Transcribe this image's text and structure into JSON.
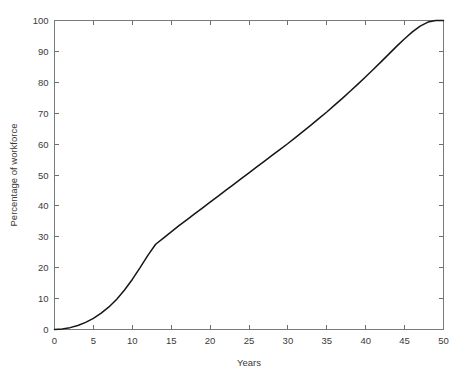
{
  "chart_data": {
    "type": "line",
    "title": "",
    "subtitle": "",
    "xlabel": "Years",
    "ylabel": "Percentage of workforce",
    "xlim": [
      0,
      50
    ],
    "ylim": [
      0,
      100
    ],
    "xticks": [
      0,
      5,
      10,
      15,
      20,
      25,
      30,
      35,
      40,
      45,
      50
    ],
    "xtick_labels": [
      "0",
      "5",
      "10",
      "15",
      "20",
      "25",
      "30",
      "35",
      "40",
      "45",
      "50"
    ],
    "yticks": [
      0,
      10,
      20,
      30,
      40,
      50,
      60,
      70,
      80,
      90,
      100
    ],
    "ytick_labels": [
      "0",
      "10",
      "20",
      "30",
      "40",
      "50",
      "60",
      "70",
      "80",
      "90",
      "100"
    ],
    "grid": false,
    "legend": false,
    "legend_position": "none",
    "line_color": "#161616",
    "line_width": 1.5,
    "frame_color": "#7a7a7a",
    "background_color": "#ffffff",
    "tick_direction": "in",
    "ticks_on_all_sides": true,
    "annotations": [],
    "series": [
      {
        "name": "Percentage of workforce",
        "x": [
          0,
          1,
          2,
          3,
          4,
          5,
          6,
          7,
          8,
          9,
          10,
          11,
          12,
          13,
          14,
          15,
          16,
          17,
          18,
          19,
          20,
          21,
          22,
          23,
          24,
          25,
          26,
          27,
          28,
          29,
          30,
          31,
          32,
          33,
          34,
          35,
          36,
          37,
          38,
          39,
          40,
          41,
          42,
          43,
          44,
          45,
          46,
          47,
          48,
          49,
          50
        ],
        "values": [
          0.0,
          0.2,
          0.6,
          1.3,
          2.3,
          3.6,
          5.3,
          7.3,
          9.8,
          12.8,
          16.2,
          20.0,
          24.0,
          27.6,
          29.6,
          31.6,
          33.6,
          35.5,
          37.4,
          39.3,
          41.2,
          43.1,
          45.0,
          46.9,
          48.8,
          50.7,
          52.6,
          54.5,
          56.4,
          58.3,
          60.2,
          62.2,
          64.2,
          66.2,
          68.3,
          70.4,
          72.6,
          74.8,
          77.1,
          79.4,
          81.8,
          84.2,
          86.7,
          89.2,
          91.7,
          94.1,
          96.3,
          98.2,
          99.5,
          100.0,
          100.0
        ]
      }
    ]
  }
}
